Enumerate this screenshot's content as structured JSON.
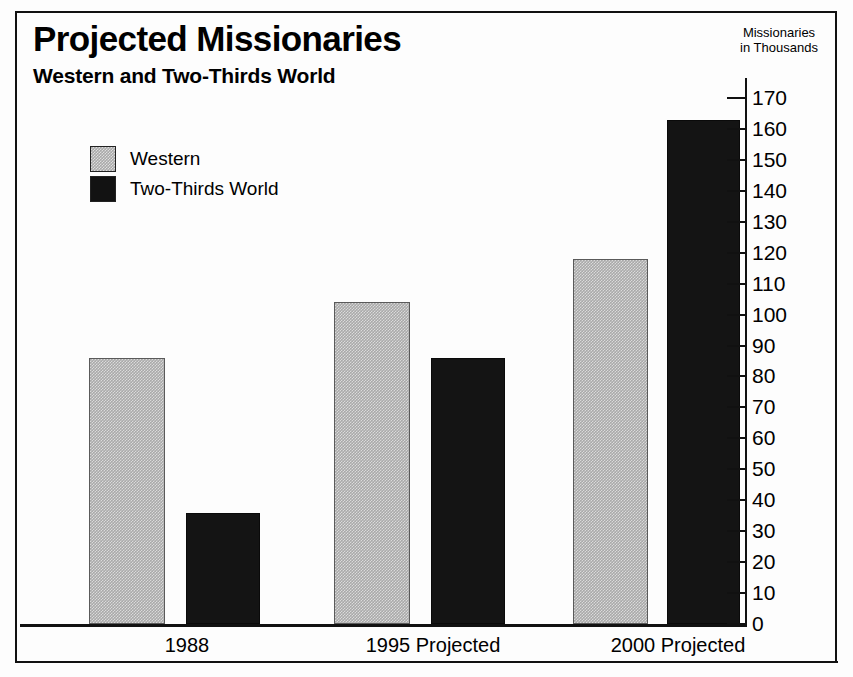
{
  "chart_data": {
    "type": "bar",
    "title": "Projected Missionaries",
    "subtitle": "Western and Two-Thirds World",
    "axis_caption_line1": "Missionaries",
    "axis_caption_line2": "in Thousands",
    "xlabel": "",
    "ylabel": "Missionaries in Thousands",
    "categories": [
      "1988",
      "1995 Projected",
      "2000 Projected"
    ],
    "series": [
      {
        "name": "Western",
        "color": "#a9a9a9",
        "values": [
          86,
          104,
          118
        ]
      },
      {
        "name": "Two-Thirds World",
        "color": "#121212",
        "values": [
          36,
          86,
          163
        ]
      }
    ],
    "ylim": [
      0,
      170
    ],
    "ytick_step": 10,
    "yticks": [
      0,
      10,
      20,
      30,
      40,
      50,
      60,
      70,
      80,
      90,
      100,
      110,
      120,
      130,
      140,
      150,
      160,
      170
    ],
    "ytick_labels": [
      "0",
      "10",
      "20",
      "30",
      "40",
      "50",
      "60",
      "70",
      "80",
      "90",
      "100",
      "110",
      "120",
      "130",
      "140",
      "150",
      "160",
      "170"
    ],
    "grid": false,
    "legend_position": "upper-left",
    "legend_entries": [
      "Western",
      "Two-Thirds World"
    ]
  }
}
